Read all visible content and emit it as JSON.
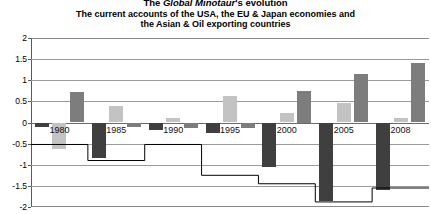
{
  "title": {
    "line1_prefix": "The ",
    "line1_italic": "Global Minotaur",
    "line1_suffix": "'s evolution",
    "line2": "The current accounts of the USA, the EU & Japan economies and",
    "line3": "the Asian & Oil exporting countries"
  },
  "colors": {
    "series_usa": "#3f3f3f",
    "series_eu": "#c3c3c3",
    "series_japan": "#7d7d7d",
    "line": "#000000",
    "gridline": "#9a9a9a",
    "axis": "#5a5a5a",
    "background": "#ffffff"
  },
  "chart_data": {
    "type": "bar",
    "title": "The Global Minotaur's evolution",
    "subtitle": "The current accounts of the USA, the EU & Japan economies and the Asian & Oil exporting countries",
    "xlabel": "",
    "ylabel": "",
    "ylim": [
      -2,
      2
    ],
    "ytick_values": [
      2,
      1.5,
      1,
      0.5,
      0,
      -0.5,
      -1,
      -1.5,
      -2
    ],
    "ytick_labels": [
      "2",
      "1.5",
      "1",
      "0.5",
      "0",
      "-0.5",
      "-1",
      "-1.5",
      "-2"
    ],
    "grid": true,
    "legend": "none",
    "categories": [
      "1980",
      "1985",
      "1990",
      "1995",
      "2000",
      "2005",
      "2008"
    ],
    "series": [
      {
        "name": "USA",
        "color": "#3f3f3f",
        "values": [
          -0.1,
          -0.85,
          -0.18,
          -0.25,
          -1.05,
          -1.85,
          -1.6
        ]
      },
      {
        "name": "EU",
        "color": "#c3c3c3",
        "values": [
          -0.62,
          0.38,
          0.1,
          0.62,
          0.22,
          0.45,
          0.1
        ]
      },
      {
        "name": "Japan",
        "color": "#7d7d7d",
        "values": [
          0.72,
          -0.1,
          -0.12,
          -0.12,
          0.75,
          1.15,
          1.42
        ]
      }
    ],
    "line_series": {
      "name": "Asian & Oil exporting countries",
      "color": "#000000",
      "style": "step",
      "values": [
        -0.52,
        -0.9,
        -0.52,
        -1.25,
        -1.45,
        -1.88,
        -1.55
      ]
    }
  }
}
